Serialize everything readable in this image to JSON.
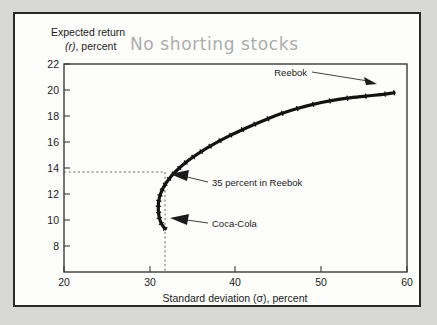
{
  "figure": {
    "handwritten_note": "No shorting stocks",
    "note_color": "#adadad",
    "curve_color": "#121212",
    "frame_color": "#2a2a2a",
    "background_color": "#fdfdfb",
    "page_color": "#d8d8d6"
  },
  "chart_data": {
    "type": "line",
    "title": "",
    "subtitle": "",
    "annotation_note": "No shorting stocks",
    "xlabel": "Standard deviation (σ), percent",
    "ylabel_line1": "Expected return",
    "ylabel_line2_italic": "(r)",
    "ylabel_line2_rest": ", percent",
    "xlim": [
      20,
      60
    ],
    "ylim": [
      6.8,
      22
    ],
    "xticks": [
      20,
      30,
      40,
      50,
      60
    ],
    "xtick_labels": [
      "20",
      "30",
      "40",
      "50",
      "60"
    ],
    "yticks": [
      8,
      10,
      12,
      14,
      16,
      18,
      20,
      22
    ],
    "ytick_labels": [
      "8",
      "10",
      "12",
      "14",
      "16",
      "18",
      "20",
      "22"
    ],
    "grid": false,
    "legend": "none",
    "series": [
      {
        "name": "Efficient frontier (no short sales)",
        "x": [
          31.8,
          31.35,
          31.12,
          31.02,
          31.0,
          31.05,
          31.2,
          31.45,
          31.8,
          32.25,
          32.8,
          33.45,
          34.2,
          35.05,
          36.0,
          37.05,
          38.2,
          39.45,
          40.8,
          42.25,
          43.8,
          45.45,
          47.2,
          49.05,
          51.0,
          53.05,
          55.2,
          57.45,
          58.5
        ],
        "y": [
          9.95,
          10.35,
          10.75,
          11.15,
          11.6,
          12.0,
          12.4,
          12.8,
          13.2,
          13.6,
          14.0,
          14.4,
          14.8,
          15.2,
          15.6,
          16.0,
          16.4,
          16.8,
          17.2,
          17.6,
          18.0,
          18.4,
          18.75,
          19.05,
          19.3,
          19.5,
          19.65,
          19.8,
          19.9
        ]
      }
    ],
    "data_labels": [
      {
        "name": "reebok-endpoint",
        "label": "Reebok",
        "x": 58.5,
        "y": 19.9,
        "arrow_direction": "right"
      },
      {
        "name": "tangency-portfolio",
        "label": "35 percent in Reebok",
        "x": 31.8,
        "y": 13.7,
        "arrow_direction": "left"
      },
      {
        "name": "coca-cola-endpoint",
        "label": "Coca-Cola",
        "x": 31.8,
        "y": 9.95,
        "arrow_direction": "left"
      }
    ],
    "guides": [
      {
        "name": "horizontal-dashed-guide",
        "orientation": "horizontal",
        "value": 13.7,
        "from": 20,
        "to": 31.8
      },
      {
        "name": "vertical-dashed-guide",
        "orientation": "vertical",
        "value": 31.8,
        "from": 6.8,
        "to": 13.7
      }
    ]
  }
}
